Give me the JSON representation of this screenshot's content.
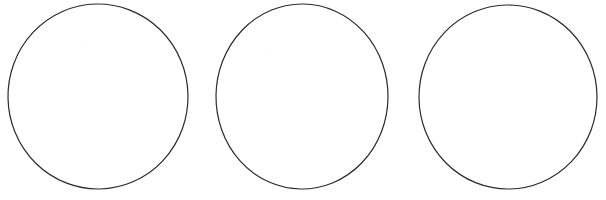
{
  "figure": {
    "background_color": "#ffffff",
    "width": 606,
    "height": 200,
    "stroke_color": "#2a2a2a",
    "stroke_width": 1.2,
    "shape_count": 3,
    "shape_kind": "circle-outline",
    "shapes": [
      {
        "label": "circle-1",
        "cx": 98,
        "cy": 96.5,
        "rx": 90,
        "ry": 92.5,
        "rotate": -1.2,
        "stroke_width": 1.2,
        "stroke_color": "#2a2a2a",
        "fill": "none"
      },
      {
        "label": "circle-2",
        "cx": 302,
        "cy": 96.5,
        "rx": 86,
        "ry": 92.5,
        "rotate": 0.8,
        "stroke_width": 1.2,
        "stroke_color": "#2a2a2a",
        "fill": "none"
      },
      {
        "label": "circle-3",
        "cx": 508,
        "cy": 97,
        "rx": 89,
        "ry": 92,
        "rotate": -0.6,
        "stroke_width": 1.2,
        "stroke_color": "#2a2a2a",
        "fill": "none"
      }
    ],
    "specks": [
      {
        "label": "speck-1",
        "x": 80,
        "y": 44,
        "size": 2,
        "color": "#fafafa"
      },
      {
        "label": "speck-2",
        "x": 270,
        "y": 48,
        "size": 2,
        "color": "#fafafa"
      }
    ]
  }
}
